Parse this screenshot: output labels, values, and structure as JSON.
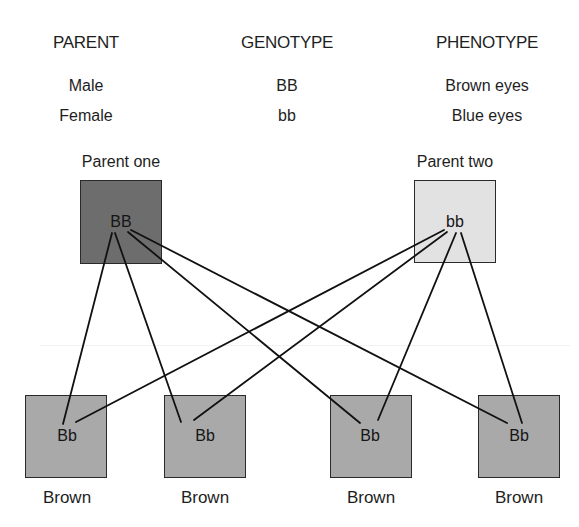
{
  "table": {
    "headers": [
      "PARENT",
      "GENOTYPE",
      "PHENOTYPE"
    ],
    "rows": [
      {
        "parent": "Male",
        "genotype": "BB",
        "phenotype": "Brown eyes"
      },
      {
        "parent": "Female",
        "genotype": "bb",
        "phenotype": "Blue eyes"
      }
    ]
  },
  "parents": [
    {
      "label": "Parent one",
      "genotype": "BB",
      "color": "#6d6d6d"
    },
    {
      "label": "Parent two",
      "genotype": "bb",
      "color": "#e2e2e2"
    }
  ],
  "offspring": [
    {
      "genotype": "Bb",
      "phenotype": "Brown",
      "color": "#a9a9a9"
    },
    {
      "genotype": "Bb",
      "phenotype": "Brown",
      "color": "#a9a9a9"
    },
    {
      "genotype": "Bb",
      "phenotype": "Brown",
      "color": "#a9a9a9"
    },
    {
      "genotype": "Bb",
      "phenotype": "Brown",
      "color": "#a9a9a9"
    }
  ],
  "connections": [
    {
      "from": "Parent one",
      "to": 1
    },
    {
      "from": "Parent one",
      "to": 2
    },
    {
      "from": "Parent one",
      "to": 3
    },
    {
      "from": "Parent one",
      "to": 4
    },
    {
      "from": "Parent two",
      "to": 1
    },
    {
      "from": "Parent two",
      "to": 2
    },
    {
      "from": "Parent two",
      "to": 3
    },
    {
      "from": "Parent two",
      "to": 4
    }
  ]
}
